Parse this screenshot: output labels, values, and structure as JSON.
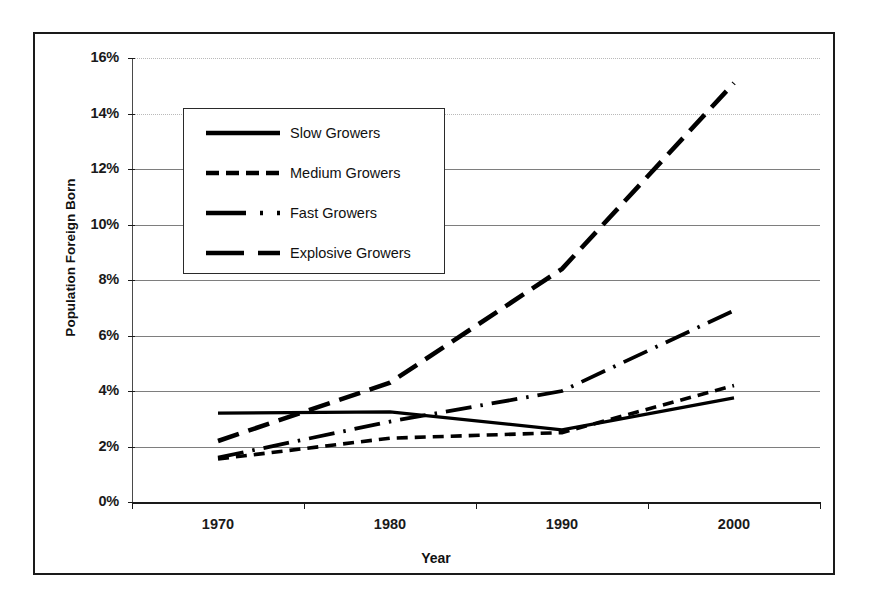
{
  "chart_data": {
    "type": "line",
    "title": "",
    "xlabel": "Year",
    "ylabel": "Population Foreign Born",
    "x": [
      1970,
      1980,
      1990,
      2000
    ],
    "xtick_labels": [
      "1970",
      "1980",
      "1990",
      "2000"
    ],
    "ytick_labels": [
      "0%",
      "2%",
      "4%",
      "6%",
      "8%",
      "10%",
      "12%",
      "14%",
      "16%"
    ],
    "ytick_values": [
      0,
      2,
      4,
      6,
      8,
      10,
      12,
      14,
      16
    ],
    "ylim": [
      0,
      16
    ],
    "yunit": "%",
    "grid": true,
    "legend_position": "top-left-inside",
    "series": [
      {
        "name": "Slow Growers",
        "style": "solid",
        "values": [
          3.2,
          3.25,
          2.6,
          3.75
        ]
      },
      {
        "name": "Medium Growers",
        "style": "dashed",
        "values": [
          1.55,
          2.3,
          2.5,
          4.2
        ]
      },
      {
        "name": "Fast Growers",
        "style": "dash-dot",
        "values": [
          1.6,
          2.9,
          4.0,
          6.9
        ]
      },
      {
        "name": "Explosive Growers",
        "style": "long-dash",
        "values": [
          2.2,
          4.3,
          8.4,
          15.1
        ]
      }
    ]
  },
  "legend": {
    "items": [
      {
        "label": "Slow Growers",
        "swatch": "solid-line-swatch"
      },
      {
        "label": "Medium Growers",
        "swatch": "dashed-line-swatch"
      },
      {
        "label": "Fast Growers",
        "swatch": "dash-dot-line-swatch"
      },
      {
        "label": "Explosive Growers",
        "swatch": "long-dash-line-swatch"
      }
    ]
  },
  "colors": {
    "series": "#000000",
    "gridline": "#7e7e7e",
    "frame": "#1a1a1a",
    "background": "#ffffff"
  }
}
